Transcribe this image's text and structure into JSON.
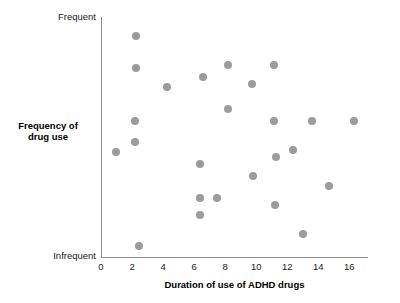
{
  "chart_data": {
    "type": "scatter",
    "title": "",
    "xlabel": "Duration of use of ADHD drugs",
    "ylabel": "Frequency of drug use",
    "xlim": [
      0,
      17.2
    ],
    "ylim": [
      0,
      100
    ],
    "grid": false,
    "legend": null,
    "xticks": [
      0,
      2,
      4,
      6,
      8,
      10,
      12,
      14,
      16
    ],
    "xtick_labels": [
      "0",
      "2",
      "4",
      "6",
      "8",
      "10",
      "12",
      "14",
      "16"
    ],
    "ytick_labels": [
      "Infrequent",
      "Frequent"
    ],
    "y_axis_end_low": "Infrequent",
    "y_axis_end_high": "Frequent",
    "marker": {
      "color": "#9c9c9c",
      "shape": "circle",
      "size_px": 8
    },
    "axis_color": "#8c8c8c",
    "n_points": 24,
    "points": [
      {
        "x": 0.95,
        "y": 44
      },
      {
        "x": 2.25,
        "y": 92
      },
      {
        "x": 2.25,
        "y": 79
      },
      {
        "x": 2.2,
        "y": 57
      },
      {
        "x": 2.2,
        "y": 48
      },
      {
        "x": 2.45,
        "y": 5
      },
      {
        "x": 4.25,
        "y": 71
      },
      {
        "x": 6.4,
        "y": 39
      },
      {
        "x": 6.4,
        "y": 25
      },
      {
        "x": 6.4,
        "y": 18
      },
      {
        "x": 6.55,
        "y": 75
      },
      {
        "x": 7.45,
        "y": 25
      },
      {
        "x": 8.2,
        "y": 80
      },
      {
        "x": 8.2,
        "y": 62
      },
      {
        "x": 9.75,
        "y": 72
      },
      {
        "x": 9.8,
        "y": 34
      },
      {
        "x": 11.15,
        "y": 80
      },
      {
        "x": 11.15,
        "y": 57
      },
      {
        "x": 11.2,
        "y": 22
      },
      {
        "x": 11.3,
        "y": 42
      },
      {
        "x": 12.4,
        "y": 45
      },
      {
        "x": 13.0,
        "y": 10
      },
      {
        "x": 13.6,
        "y": 57
      },
      {
        "x": 14.7,
        "y": 30
      },
      {
        "x": 16.3,
        "y": 57
      }
    ]
  },
  "side_note": {
    "lines": [
      "",
      "",
      "",
      "",
      ""
    ]
  }
}
